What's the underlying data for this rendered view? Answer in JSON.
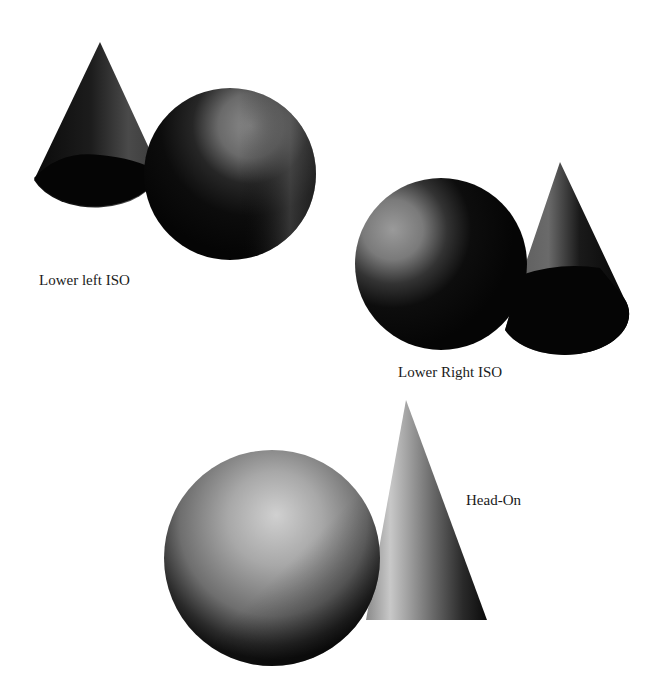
{
  "figure": {
    "views": [
      {
        "id": "lower-left-iso",
        "label": "Lower left ISO"
      },
      {
        "id": "lower-right-iso",
        "label": "Lower Right ISO"
      },
      {
        "id": "head-on",
        "label": "Head-On"
      }
    ]
  },
  "colors": {
    "background": "#ffffff",
    "shadow": "#000000",
    "highlight": "#d8d8d8",
    "label": "#1a1a1a"
  }
}
